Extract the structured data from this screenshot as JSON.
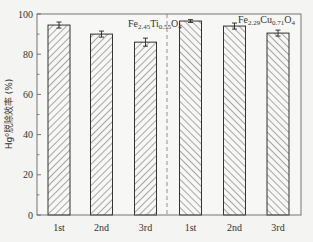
{
  "chart_data": {
    "type": "bar",
    "title": "",
    "xlabel": "",
    "ylabel": "Hg⁰脱除效率 (%)",
    "ylim": [
      0,
      100
    ],
    "yticks": [
      0,
      20,
      40,
      60,
      80,
      100
    ],
    "grid": false,
    "categories": [
      "1st",
      "2nd",
      "3rd",
      "1st",
      "2nd",
      "3rd"
    ],
    "groups": [
      {
        "name": "Fe2.45Ti0.55O4",
        "label_main": "Fe",
        "label_parts": [
          [
            "Fe",
            ""
          ],
          [
            "2.45",
            "sub"
          ],
          [
            "Ti",
            ""
          ],
          [
            "0.55",
            "sub"
          ],
          [
            "O",
            ""
          ],
          [
            "4",
            "sub"
          ]
        ],
        "categories": [
          "1st",
          "2nd",
          "3rd"
        ],
        "values": [
          94.5,
          90.0,
          86.0
        ],
        "errors": [
          1.5,
          1.5,
          2.0
        ],
        "hatch": "forward-diagonal"
      },
      {
        "name": "Fe2.29Cu0.71O4",
        "label_parts": [
          [
            "Fe",
            ""
          ],
          [
            "2.29",
            "sub"
          ],
          [
            "Cu",
            ""
          ],
          [
            "0.71",
            "sub"
          ],
          [
            "O",
            ""
          ],
          [
            "4",
            "sub"
          ]
        ],
        "categories": [
          "1st",
          "2nd",
          "3rd"
        ],
        "values": [
          96.5,
          94.0,
          90.5
        ],
        "errors": [
          0.7,
          1.5,
          1.5
        ],
        "hatch": "back-diagonal"
      }
    ],
    "divider": "dashed vertical line between groups",
    "colors": {
      "axis": "#555555",
      "bar_edge": "#333333",
      "hatch": "#555555",
      "background": "#f4f4f2"
    }
  }
}
